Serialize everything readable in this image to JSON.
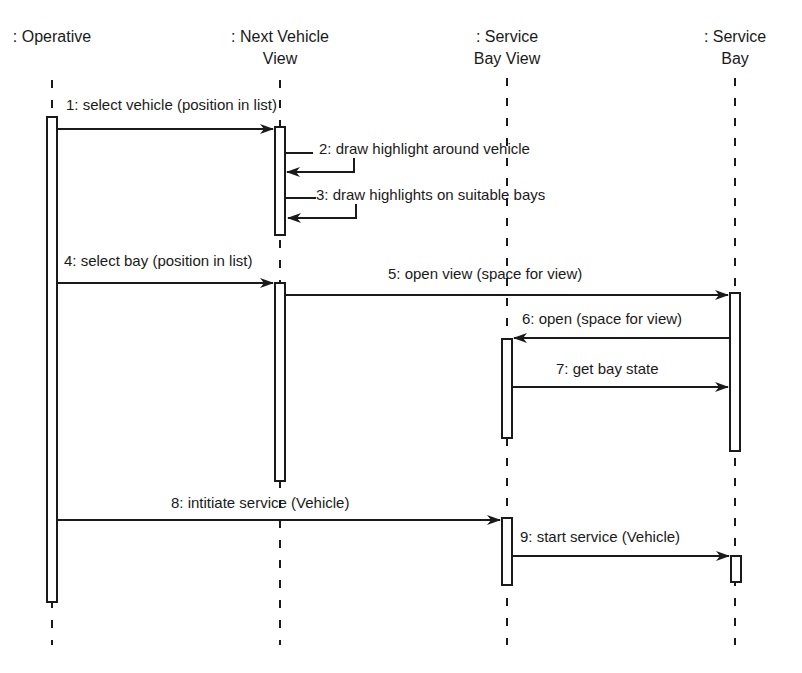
{
  "diagram": {
    "type": "UML sequence diagram",
    "colors": {
      "ink": "#1a1a1a",
      "background": "#ffffff"
    },
    "lifelines": [
      {
        "id": "operative",
        "label_line1": ": Operative",
        "label_line2": "",
        "x": 52
      },
      {
        "id": "next-vehicle-view",
        "label_line1": ": Next Vehicle",
        "label_line2": "View",
        "x": 280
      },
      {
        "id": "service-bay-view",
        "label_line1": ": Service",
        "label_line2": "Bay View",
        "x": 507
      },
      {
        "id": "service-bay",
        "label_line1": ": Service",
        "label_line2": "Bay",
        "x": 735
      }
    ],
    "messages": [
      {
        "n": 1,
        "label": "1: select vehicle (position in list)",
        "from": "operative",
        "to": "next-vehicle-view"
      },
      {
        "n": 2,
        "label": "2: draw highlight around vehicle",
        "from": "next-vehicle-view",
        "to": "next-vehicle-view",
        "self": true
      },
      {
        "n": 3,
        "label": "3: draw highlights on suitable bays",
        "from": "next-vehicle-view",
        "to": "next-vehicle-view",
        "self": true
      },
      {
        "n": 4,
        "label": "4: select bay (position in list)",
        "from": "operative",
        "to": "next-vehicle-view"
      },
      {
        "n": 5,
        "label": "5: open view (space for view)",
        "from": "next-vehicle-view",
        "to": "service-bay"
      },
      {
        "n": 6,
        "label": "6: open (space for view)",
        "from": "service-bay",
        "to": "service-bay-view"
      },
      {
        "n": 7,
        "label": "7: get bay state",
        "from": "service-bay-view",
        "to": "service-bay"
      },
      {
        "n": 8,
        "label": "8: intitiate service (Vehicle)",
        "from": "operative",
        "to": "service-bay-view"
      },
      {
        "n": 9,
        "label": "9: start service (Vehicle)",
        "from": "service-bay-view",
        "to": "service-bay"
      }
    ]
  }
}
